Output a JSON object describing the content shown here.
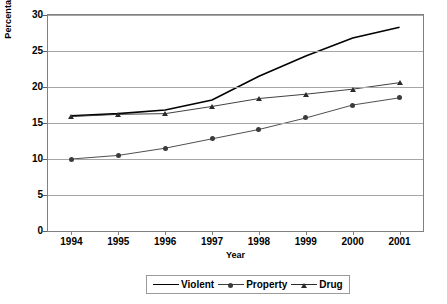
{
  "chart_data": {
    "type": "line",
    "title": "",
    "xlabel": "Year",
    "ylabel": "Percentage of All Arrests",
    "categories": [
      "1994",
      "1995",
      "1996",
      "1997",
      "1998",
      "1999",
      "2000",
      "2001"
    ],
    "x": [
      1994,
      1995,
      1996,
      1997,
      1998,
      1999,
      2000,
      2001
    ],
    "ylim": [
      0,
      30
    ],
    "yticks": [
      0,
      5,
      10,
      15,
      20,
      25,
      30
    ],
    "ytick_labels": [
      "0",
      "5",
      "10",
      "15",
      "20",
      "25",
      "30"
    ],
    "grid": "horizontal",
    "legend_position": "bottom-center",
    "series": [
      {
        "name": "Violent",
        "marker": "none",
        "color": "#000000",
        "values": [
          16.0,
          16.3,
          16.8,
          18.2,
          21.5,
          24.3,
          26.8,
          28.3
        ]
      },
      {
        "name": "Property",
        "marker": "circle",
        "color": "#3b3b3b",
        "values": [
          10.0,
          10.5,
          11.5,
          12.8,
          14.1,
          15.7,
          17.5,
          18.5
        ]
      },
      {
        "name": "Drug",
        "marker": "triangle",
        "color": "#2b2b2b",
        "values": [
          15.9,
          16.2,
          16.3,
          17.3,
          18.4,
          19.0,
          19.7,
          20.6
        ]
      }
    ]
  },
  "axes": {
    "y_title": "Percentage of All Arrests",
    "x_title": "Year",
    "y_tick_labels": [
      "30",
      "25",
      "20",
      "15",
      "10",
      "5",
      "0"
    ],
    "x_tick_labels": [
      "1994",
      "1995",
      "1996",
      "1997",
      "1998",
      "1999",
      "2000",
      "2001"
    ]
  },
  "legend": {
    "items": [
      {
        "label": "Violent"
      },
      {
        "label": "Property"
      },
      {
        "label": "Drug"
      }
    ]
  },
  "colors": {
    "series_violent": "#000000",
    "series_property": "#3b3b3b",
    "series_drug": "#2b2b2b",
    "gridline": "#a6a6a6",
    "frame": "#808080",
    "background": "#ffffff"
  }
}
